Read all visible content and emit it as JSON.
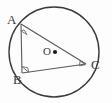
{
  "figure": {
    "type": "circle-inscribed-triangle",
    "background_color": "#fdfdfd",
    "stroke_color": "#3a3a3a",
    "label_color": "#3a3a3a"
  },
  "circle": {
    "name": "circumscribed-circle",
    "center_x": 54,
    "center_y": 52,
    "radius": 45,
    "stroke_width": 1.4
  },
  "center": {
    "label": "O",
    "dot_x": 55,
    "dot_y": 52,
    "dot_radius": 2.1
  },
  "vertices": [
    {
      "label": "A",
      "x": 21,
      "y": 24
    },
    {
      "label": "B",
      "x": 22,
      "y": 73
    },
    {
      "label": "C",
      "x": 86,
      "y": 64
    }
  ],
  "segments": [
    {
      "name": "side-AB",
      "from": "A",
      "to": "B"
    },
    {
      "name": "side-BC",
      "from": "B",
      "to": "C"
    },
    {
      "name": "side-AC",
      "from": "A",
      "to": "C"
    }
  ],
  "angle_markers": [
    {
      "name": "angle-marker-A",
      "at": "A"
    },
    {
      "name": "angle-marker-B",
      "at": "B"
    },
    {
      "name": "angle-marker-C",
      "at": "C"
    }
  ]
}
